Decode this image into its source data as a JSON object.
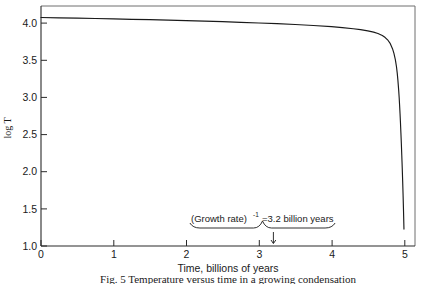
{
  "figure": {
    "caption": "Fig. 5  Temperature versus time in a growing condensation",
    "caption_visible_fragment": "Fig. 5  Temperature versus time in a growing condensation"
  },
  "chart_data": {
    "type": "line",
    "title": "",
    "xlabel": "Time, billions of years",
    "ylabel": "log T",
    "xlim": [
      0,
      5.15
    ],
    "ylim": [
      1.0,
      4.12
    ],
    "grid": false,
    "legend": "none",
    "xticks": [
      0,
      1,
      2,
      3,
      4,
      5
    ],
    "xtick_labels": [
      "0",
      "1",
      "2",
      "3",
      "4",
      "5"
    ],
    "yticks": [
      1.0,
      1.5,
      2.0,
      2.5,
      3.0,
      3.5,
      4.0
    ],
    "ytick_labels": [
      "1.0",
      "1.5",
      "2.0",
      "2.5",
      "3.0",
      "3.5",
      "4.0"
    ],
    "series": [
      {
        "name": "log T",
        "x": [
          0.0,
          0.25,
          0.5,
          0.75,
          1.0,
          1.25,
          1.5,
          1.75,
          2.0,
          2.25,
          2.5,
          2.75,
          3.0,
          3.25,
          3.5,
          3.75,
          4.0,
          4.15,
          4.3,
          4.4,
          4.5,
          4.58,
          4.64,
          4.7,
          4.74,
          4.78,
          4.81,
          4.84,
          4.86,
          4.88,
          4.895,
          4.905,
          4.915,
          4.925,
          4.932,
          4.938,
          4.944,
          4.95,
          4.956,
          4.962,
          4.968,
          4.974,
          4.98,
          4.986,
          4.992,
          4.998
        ],
        "y": [
          3.97,
          3.966,
          3.962,
          3.957,
          3.952,
          3.947,
          3.942,
          3.936,
          3.93,
          3.923,
          3.916,
          3.908,
          3.899,
          3.89,
          3.879,
          3.866,
          3.851,
          3.839,
          3.824,
          3.812,
          3.796,
          3.78,
          3.762,
          3.736,
          3.71,
          3.672,
          3.63,
          3.565,
          3.505,
          3.42,
          3.33,
          3.25,
          3.15,
          3.03,
          2.93,
          2.83,
          2.72,
          2.6,
          2.47,
          2.33,
          2.18,
          2.02,
          1.85,
          1.66,
          1.45,
          1.22
        ]
      }
    ],
    "annotations": [
      {
        "name": "growth-rate-annotation",
        "text_prefix": "(Growth rate)",
        "text_superscript": "-1",
        "text_suffix": "=3.2 billion years",
        "full_text": "(Growth rate)-1 =3.2 billion years",
        "brace_x_start": 2.05,
        "brace_x_end": 4.05,
        "pointer_x": 3.2,
        "pointer_y": 1.0,
        "label_y": 1.33
      }
    ],
    "colors": {
      "curve": "#1a1a1a",
      "axis": "#2a2a2a",
      "frame": "#6f6f6f",
      "text": "#1a1a1a",
      "background": "#ffffff"
    }
  }
}
